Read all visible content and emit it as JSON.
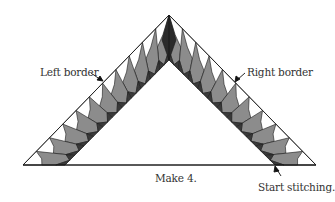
{
  "labels": {
    "left_border": "Left border",
    "right_border": "Right border",
    "make": "Make 4.",
    "start": "Start stitching."
  },
  "colors": {
    "outline": "#1a1a1a",
    "light": "#ffffff",
    "mid": "#8c8c8c",
    "dark": "#3a3a3a",
    "apex": "#2b2b2b"
  },
  "units_per_side": 11
}
